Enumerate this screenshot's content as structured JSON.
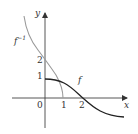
{
  "diagram": {
    "axes": {
      "x_label": "x",
      "y_label": "y",
      "origin_label": "0",
      "x_ticks": [
        "1",
        "2"
      ],
      "y_ticks": [
        "1",
        "2"
      ]
    },
    "curves": [
      {
        "name": "f",
        "label": "f",
        "color": "#222222"
      },
      {
        "name": "f_inverse",
        "label_base": "f",
        "label_sup": "−1",
        "color": "#9a9a9a"
      }
    ]
  },
  "colors": {
    "axis": "#333333",
    "f": "#222222",
    "f_inverse": "#9a9a9a",
    "background": "#ffffff"
  }
}
